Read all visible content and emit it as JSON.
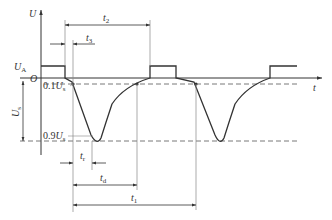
{
  "diagram": {
    "type": "pulse timing waveform",
    "axes": {
      "y_label": "U",
      "x_label": "t",
      "origin_label": "O"
    },
    "levels": {
      "high_level": {
        "main": "U",
        "sub": "A"
      },
      "tenth_level": {
        "prefix": "0.1",
        "main": "U",
        "sub": "s"
      },
      "ninety_level": {
        "prefix": "0.9",
        "main": "U",
        "sub": "s"
      },
      "amplitude": {
        "main": "U",
        "sub": "s"
      }
    },
    "intervals": {
      "t1": {
        "main": "t",
        "sub": "1"
      },
      "t2": {
        "main": "t",
        "sub": "2"
      },
      "t3": {
        "main": "t",
        "sub": "3"
      },
      "tr": {
        "main": "t",
        "sub": "r"
      },
      "td": {
        "main": "t",
        "sub": "d"
      }
    },
    "colors": {
      "stroke": "#333333",
      "guide": "#999999",
      "background": "#ffffff"
    }
  }
}
